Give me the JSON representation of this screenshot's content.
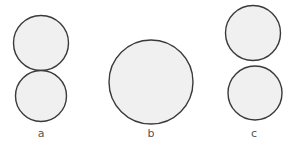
{
  "figure": {
    "background_color": "#ffffff",
    "circle_fill_color": "#f0f0f0",
    "circle_stroke_color": "#3a3a3a",
    "label_color": "#555555",
    "width": 293,
    "height": 147,
    "panels": [
      {
        "label": "a",
        "label_x": 41,
        "label_y": 127,
        "description": "two tangent circles stacked vertically",
        "circles": [
          {
            "cx": 41,
            "cy": 43,
            "r": 27.5
          },
          {
            "cx": 41,
            "cy": 96,
            "r": 25.5
          }
        ]
      },
      {
        "label": "b",
        "label_x": 151,
        "label_y": 127,
        "description": "one large circle",
        "circles": [
          {
            "cx": 151,
            "cy": 82,
            "r": 42
          }
        ]
      },
      {
        "label": "c",
        "label_x": 254,
        "label_y": 127,
        "description": "two separated circles stacked vertically",
        "circles": [
          {
            "cx": 253,
            "cy": 33,
            "r": 27.5
          },
          {
            "cx": 255,
            "cy": 93,
            "r": 27
          }
        ]
      }
    ]
  }
}
